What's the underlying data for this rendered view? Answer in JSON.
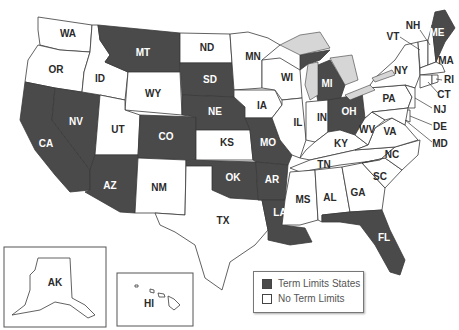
{
  "map": {
    "title": "U.S. States with Legislative Term Limits",
    "colors": {
      "term_limits": "#4a4a4a",
      "no_term_limits": "#ffffff",
      "lakes": "#d6d6d6",
      "border": "#3a3a3a"
    },
    "states": {
      "WA": "WA",
      "OR": "OR",
      "CA": "CA",
      "NV": "NV",
      "ID": "ID",
      "MT": "MT",
      "WY": "WY",
      "UT": "UT",
      "AZ": "AZ",
      "CO": "CO",
      "NM": "NM",
      "ND": "ND",
      "SD": "SD",
      "NE": "NE",
      "KS": "KS",
      "OK": "OK",
      "TX": "TX",
      "MN": "MN",
      "IA": "IA",
      "MO": "MO",
      "AR": "AR",
      "LA": "LA",
      "WI": "WI",
      "IL": "IL",
      "MI": "MI",
      "IN": "IN",
      "OH": "OH",
      "KY": "KY",
      "TN": "TN",
      "MS": "MS",
      "AL": "AL",
      "GA": "GA",
      "FL": "FL",
      "SC": "SC",
      "NC": "NC",
      "VA": "VA",
      "WV": "WV",
      "PA": "PA",
      "NY": "NY",
      "VT": "VT",
      "NH": "NH",
      "ME": "ME",
      "MA": "MA",
      "RI": "RI",
      "CT": "CT",
      "NJ": "NJ",
      "DE": "DE",
      "MD": "MD",
      "AK": "AK",
      "HI": "HI"
    },
    "term_limit_states": [
      "CA",
      "NV",
      "AZ",
      "MT",
      "CO",
      "SD",
      "NE",
      "OK",
      "MO",
      "AR",
      "LA",
      "MI",
      "OH",
      "FL",
      "ME"
    ],
    "no_term_limit_states": [
      "WA",
      "OR",
      "ID",
      "WY",
      "UT",
      "NM",
      "ND",
      "KS",
      "TX",
      "MN",
      "IA",
      "WI",
      "IL",
      "IN",
      "KY",
      "TN",
      "MS",
      "AL",
      "GA",
      "SC",
      "NC",
      "VA",
      "WV",
      "PA",
      "NY",
      "VT",
      "NH",
      "MA",
      "RI",
      "CT",
      "NJ",
      "DE",
      "MD",
      "AK",
      "HI"
    ]
  },
  "legend": {
    "items": [
      {
        "label": "Term Limits States",
        "color": "#4a4a4a"
      },
      {
        "label": "No Term Limits",
        "color": "#ffffff"
      }
    ]
  }
}
